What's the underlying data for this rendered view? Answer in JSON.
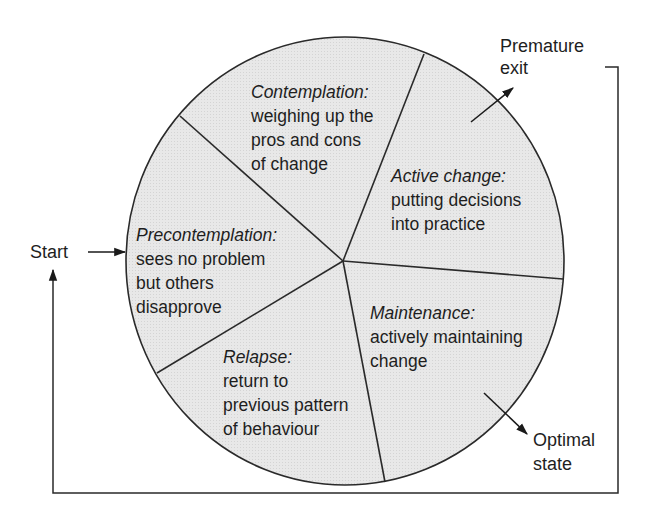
{
  "diagram": {
    "type": "cycle",
    "colors": {
      "fill": "#e6e6e6",
      "stroke": "#2a2a2a",
      "background": "#ffffff"
    },
    "stages": [
      {
        "title": "Contemplation:",
        "lines": [
          "weighing up the",
          "pros and cons",
          "of change"
        ]
      },
      {
        "title": "Active change:",
        "lines": [
          "putting decisions",
          "into practice"
        ]
      },
      {
        "title": "Maintenance:",
        "lines": [
          "actively maintaining",
          "change"
        ]
      },
      {
        "title": "Relapse:",
        "lines": [
          "return to",
          "previous pattern",
          "of behaviour"
        ]
      },
      {
        "title": "Precontemplation:",
        "lines": [
          "sees no problem",
          "but others",
          "disapprove"
        ]
      }
    ],
    "labels": {
      "start": "Start",
      "premature_exit": [
        "Premature",
        "exit"
      ],
      "optimal_state": [
        "Optimal",
        "state"
      ]
    }
  }
}
